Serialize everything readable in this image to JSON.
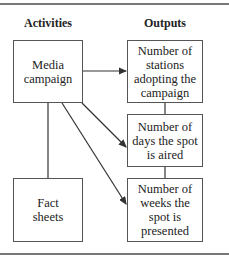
{
  "headers": {
    "activities": "Activities",
    "outputs": "Outputs"
  },
  "activities": [
    {
      "label": "Media campaign"
    },
    {
      "label": "Fact sheets"
    }
  ],
  "outputs": [
    {
      "label": "Number of stations adopting the campaign"
    },
    {
      "label": "Number of days the spot is aired"
    },
    {
      "label": "Number of weeks the spot is presented"
    }
  ],
  "connections": [
    {
      "from": "Media campaign",
      "to": "Number of stations adopting the campaign",
      "type": "arrow"
    },
    {
      "from": "Media campaign",
      "to": "Number of days the spot is aired",
      "type": "arrow"
    },
    {
      "from": "Media campaign",
      "to": "Number of weeks the spot is presented",
      "type": "arrow"
    },
    {
      "from": "Media campaign",
      "to": "Fact sheets",
      "type": "line"
    },
    {
      "from": "Number of stations adopting the campaign",
      "to": "Number of days the spot is aired",
      "type": "line"
    },
    {
      "from": "Number of days the spot is aired",
      "to": "Number of weeks the spot is presented",
      "type": "line"
    }
  ]
}
